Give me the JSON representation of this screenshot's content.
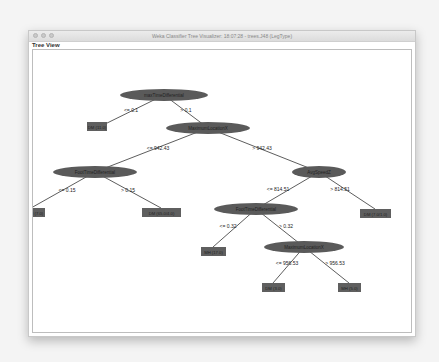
{
  "window": {
    "title": "Weka Classifier Tree Visualizer: 18:07:28 - trees.J48 (LegType)",
    "panel_label": "Tree View"
  },
  "colors": {
    "node_fill": "#5a5a5a",
    "leaf_fill": "#5f5f5f",
    "edge": "#333333",
    "node_text": "#222222"
  },
  "tree": {
    "nodes": [
      {
        "id": "n0",
        "type": "split",
        "label": "maxTimeDifferential"
      },
      {
        "id": "n1",
        "type": "leaf",
        "label": "DM (11.0)"
      },
      {
        "id": "n2",
        "type": "split",
        "label": "MaximumLocationX"
      },
      {
        "id": "n3",
        "type": "split",
        "label": "FootTimeDifferential"
      },
      {
        "id": "n4",
        "type": "leaf",
        "label": "MH (7.0)"
      },
      {
        "id": "n5",
        "type": "leaf",
        "label": "DM (65.0/4.0)"
      },
      {
        "id": "n6",
        "type": "split",
        "label": "AvgSpeedZ"
      },
      {
        "id": "n7",
        "type": "split",
        "label": "FootTimeDifferential"
      },
      {
        "id": "n8",
        "type": "leaf",
        "label": "DM (7.0/1.0)"
      },
      {
        "id": "n9",
        "type": "leaf",
        "label": "MH (17.0)"
      },
      {
        "id": "n10",
        "type": "split",
        "label": "MaximumLocationX"
      },
      {
        "id": "n11",
        "type": "leaf",
        "label": "DM (3.0)"
      },
      {
        "id": "n12",
        "type": "leaf",
        "label": "MH (5.0)"
      }
    ],
    "edges": [
      {
        "from": "n0",
        "to": "n1",
        "label": "<= 0.1"
      },
      {
        "from": "n0",
        "to": "n2",
        "label": "> 0.1"
      },
      {
        "from": "n2",
        "to": "n3",
        "label": "<= 942.43"
      },
      {
        "from": "n2",
        "to": "n6",
        "label": "> 942.43"
      },
      {
        "from": "n3",
        "to": "n4",
        "label": "<= 0.15"
      },
      {
        "from": "n3",
        "to": "n5",
        "label": "> 0.15"
      },
      {
        "from": "n6",
        "to": "n7",
        "label": "<= 814.51"
      },
      {
        "from": "n6",
        "to": "n8",
        "label": "> 814.51"
      },
      {
        "from": "n7",
        "to": "n9",
        "label": "<= 0.32"
      },
      {
        "from": "n7",
        "to": "n10",
        "label": "> 0.32"
      },
      {
        "from": "n10",
        "to": "n11",
        "label": "<= 956.53"
      },
      {
        "from": "n10",
        "to": "n12",
        "label": "> 956.53"
      }
    ]
  }
}
